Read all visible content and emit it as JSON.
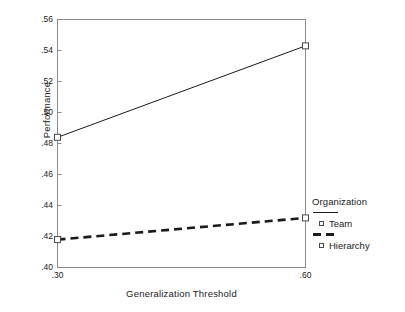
{
  "chart_data": {
    "type": "line",
    "title": "",
    "xlabel": "Generalization Threshold",
    "ylabel": "Performance",
    "x": [
      0.3,
      0.6
    ],
    "xticklabels": [
      ".30",
      ".60"
    ],
    "xlim": [
      0.3,
      0.6
    ],
    "ylim": [
      0.4,
      0.56
    ],
    "yticks": [
      0.4,
      0.42,
      0.44,
      0.46,
      0.48,
      0.5,
      0.52,
      0.54,
      0.56
    ],
    "yticklabels": [
      ".40",
      ".42",
      ".44",
      ".46",
      ".48",
      ".50",
      ".52",
      ".54",
      ".56"
    ],
    "grid": false,
    "legend_position": "right",
    "legend_title": "Organization",
    "series": [
      {
        "name": "Team",
        "values": [
          0.484,
          0.543
        ],
        "linestyle": "solid",
        "marker": "open-square",
        "color": "#1a1a1a"
      },
      {
        "name": "Hierarchy",
        "values": [
          0.418,
          0.432
        ],
        "linestyle": "dashed",
        "marker": "open-square",
        "color": "#1a1a1a"
      }
    ]
  },
  "axes": {
    "y_label": "Performance",
    "x_label": "Generalization Threshold",
    "y_ticks": [
      {
        "label": ".56",
        "value": 0.56
      },
      {
        "label": ".54",
        "value": 0.54
      },
      {
        "label": ".52",
        "value": 0.52
      },
      {
        "label": ".50",
        "value": 0.5
      },
      {
        "label": ".48",
        "value": 0.48
      },
      {
        "label": ".46",
        "value": 0.46
      },
      {
        "label": ".44",
        "value": 0.44
      },
      {
        "label": ".42",
        "value": 0.42
      },
      {
        "label": ".40",
        "value": 0.4
      }
    ],
    "x_ticks": [
      {
        "label": ".30",
        "value": 0.3
      },
      {
        "label": ".60",
        "value": 0.6
      }
    ]
  },
  "legend": {
    "title": "Organization",
    "entries": [
      {
        "label": "Team",
        "linestyle": "solid"
      },
      {
        "label": "Hierarchy",
        "linestyle": "dashed"
      }
    ]
  },
  "colors": {
    "line": "#1a1a1a",
    "axis": "#8a8a8a",
    "marker_edge": "#4a4a4a",
    "background": "#ffffff"
  }
}
